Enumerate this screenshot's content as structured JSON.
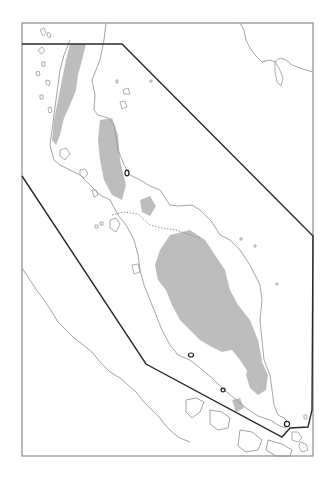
{
  "map": {
    "type": "regional outline map",
    "frame": {
      "x": 22,
      "y": 23,
      "width": 291,
      "height": 433,
      "stroke": "#8a8a8a"
    },
    "colors": {
      "background": "#ffffff",
      "coastline": "#9a9a9a",
      "highland_fill": "#bdbdbd",
      "boundary_polygon": "#2a2a2a",
      "border_dotted": "#777777",
      "marker": "#222222"
    },
    "boundary_polygon": [
      [
        22,
        44
      ],
      [
        122,
        44
      ],
      [
        313,
        236
      ],
      [
        312,
        410
      ],
      [
        308,
        427
      ],
      [
        290,
        428
      ],
      [
        282,
        437
      ],
      [
        146,
        364
      ],
      [
        22,
        176
      ]
    ],
    "markers": [
      {
        "name": "marker-north",
        "x": 127,
        "y": 173
      },
      {
        "name": "marker-central",
        "x": 191,
        "y": 355
      },
      {
        "name": "marker-south",
        "x": 223,
        "y": 390
      },
      {
        "name": "marker-tip",
        "x": 287,
        "y": 424
      }
    ]
  }
}
